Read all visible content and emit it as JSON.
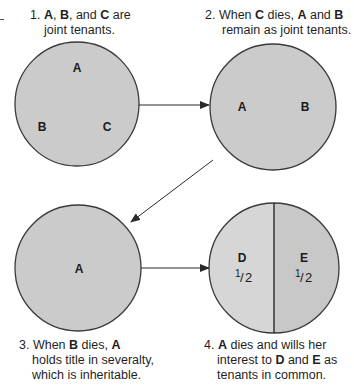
{
  "diagram": {
    "colors": {
      "circle_fill": "#cbcbcb",
      "circle_fill_light": "#d6d6d6",
      "circle_stroke": "#3a3a3a",
      "arrow": "#2a2a2a"
    },
    "stages": [
      {
        "number": "1.",
        "caption_parts": [
          {
            "text": "A",
            "bold": true
          },
          {
            "text": ", ",
            "bold": false
          },
          {
            "text": "B",
            "bold": true
          },
          {
            "text": ", and ",
            "bold": false
          },
          {
            "text": "C",
            "bold": true
          },
          {
            "text": " are",
            "bold": false
          }
        ],
        "caption_line2": "joint tenants.",
        "labels": [
          "A",
          "B",
          "C"
        ]
      },
      {
        "number": "2.",
        "caption_parts": [
          {
            "text": "When ",
            "bold": false
          },
          {
            "text": "C",
            "bold": true
          },
          {
            "text": " dies, ",
            "bold": false
          },
          {
            "text": "A",
            "bold": true
          },
          {
            "text": " and ",
            "bold": false
          },
          {
            "text": "B",
            "bold": true
          }
        ],
        "caption_line2": "remain as joint tenants.",
        "labels": [
          "A",
          "B"
        ]
      },
      {
        "number": "3.",
        "caption_parts": [
          {
            "text": "When ",
            "bold": false
          },
          {
            "text": "B",
            "bold": true
          },
          {
            "text": " dies, ",
            "bold": false
          },
          {
            "text": "A",
            "bold": true
          }
        ],
        "caption_line2": "holds title in severalty,",
        "caption_line3": "which is inheritable.",
        "labels": [
          "A"
        ]
      },
      {
        "number": "4.",
        "caption_parts": [
          {
            "text": "A",
            "bold": true
          },
          {
            "text": " dies and wills her",
            "bold": false
          }
        ],
        "caption_line2_parts": [
          {
            "text": "interest to ",
            "bold": false
          },
          {
            "text": "D",
            "bold": true
          },
          {
            "text": " and ",
            "bold": false
          },
          {
            "text": "E",
            "bold": true
          },
          {
            "text": " as",
            "bold": false
          }
        ],
        "caption_line3": "tenants in common.",
        "labels": [
          "D",
          "E"
        ],
        "shares": [
          {
            "owner": "D",
            "numerator": "1",
            "denominator": "2"
          },
          {
            "owner": "E",
            "numerator": "1",
            "denominator": "2"
          }
        ]
      }
    ],
    "arrows": [
      {
        "from": "stage-1",
        "to": "stage-2"
      },
      {
        "from": "stage-2",
        "to": "stage-3"
      },
      {
        "from": "stage-3",
        "to": "stage-4"
      }
    ]
  }
}
